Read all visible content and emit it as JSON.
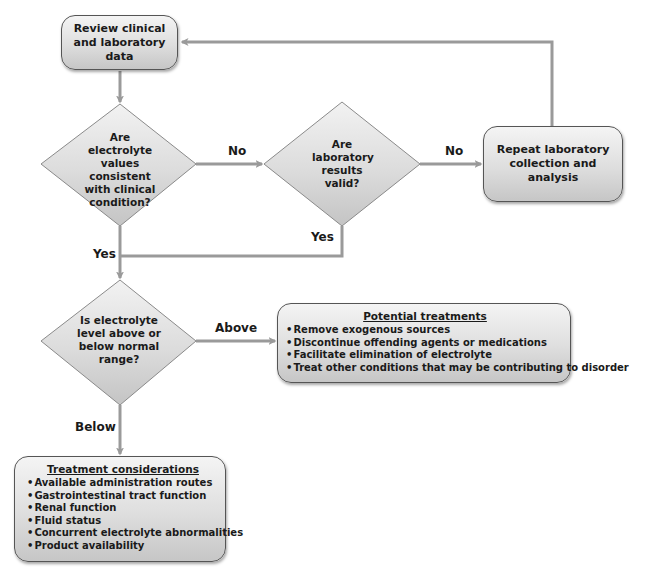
{
  "diagram": {
    "nodes": {
      "review": {
        "label": "Review clinical and laboratory data"
      },
      "consistent": {
        "label": "Are electrolyte values consistent with clinical condition?"
      },
      "valid": {
        "label": "Are laboratory results valid?"
      },
      "repeat": {
        "label": "Repeat laboratory collection and analysis"
      },
      "level": {
        "label": "Is electrolyte level above or below normal range?"
      },
      "potential": {
        "heading": "Potential treatments",
        "items": [
          "Remove exogenous sources",
          "Discontinue offending agents or medications",
          "Facilitate elimination of electrolyte",
          "Treat other conditions that may be contributing to disorder"
        ]
      },
      "considerations": {
        "heading": "Treatment considerations",
        "items": [
          "Available administration routes",
          "Gastrointestinal tract function",
          "Renal function",
          "Fluid status",
          "Concurrent electrolyte abnormalities",
          "Product availability"
        ]
      }
    },
    "edges": {
      "consistent_no": "No",
      "valid_no": "No",
      "valid_yes": "Yes",
      "consistent_yes": "Yes",
      "level_above": "Above",
      "level_below": "Below"
    },
    "colors": {
      "arrow": "#9a9a9a",
      "box_border": "#555555",
      "fill_light": "#f4f4f4",
      "fill_dark": "#c6c6c6"
    }
  }
}
